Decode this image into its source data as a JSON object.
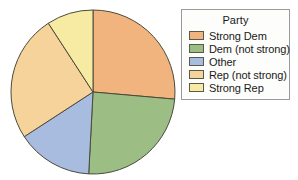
{
  "legend": {
    "title": "Party",
    "position": "right",
    "entries": [
      {
        "label": "Strong Dem",
        "color": "#f2b47e"
      },
      {
        "label": "Dem (not strong)",
        "color": "#9cbd84"
      },
      {
        "label": "Other",
        "color": "#a8bce0"
      },
      {
        "label": "Rep (not strong)",
        "color": "#f6d39a"
      },
      {
        "label": "Strong Rep",
        "color": "#f7eba3"
      }
    ]
  },
  "chart_data": {
    "type": "pie",
    "title": "",
    "legend_title": "Party",
    "legend_position": "right",
    "categories": [
      "Strong Dem",
      "Dem (not strong)",
      "Other",
      "Rep (not strong)",
      "Strong Rep"
    ],
    "values": [
      26.4,
      24.4,
      15.0,
      25.0,
      9.2
    ],
    "unit": "percent",
    "colors": [
      "#f2b47e",
      "#9cbd84",
      "#a8bce0",
      "#f6d39a",
      "#f7eba3"
    ],
    "start_angle_deg": 0,
    "direction": "clockwise",
    "boundary_angles_deg": [
      0,
      95,
      183,
      237,
      327,
      360
    ],
    "geometry": {
      "cx": 93,
      "cy": 92,
      "r": 82
    },
    "stroke_color": "#4a4a3c",
    "grid": false,
    "xlabel": "",
    "ylabel": ""
  }
}
